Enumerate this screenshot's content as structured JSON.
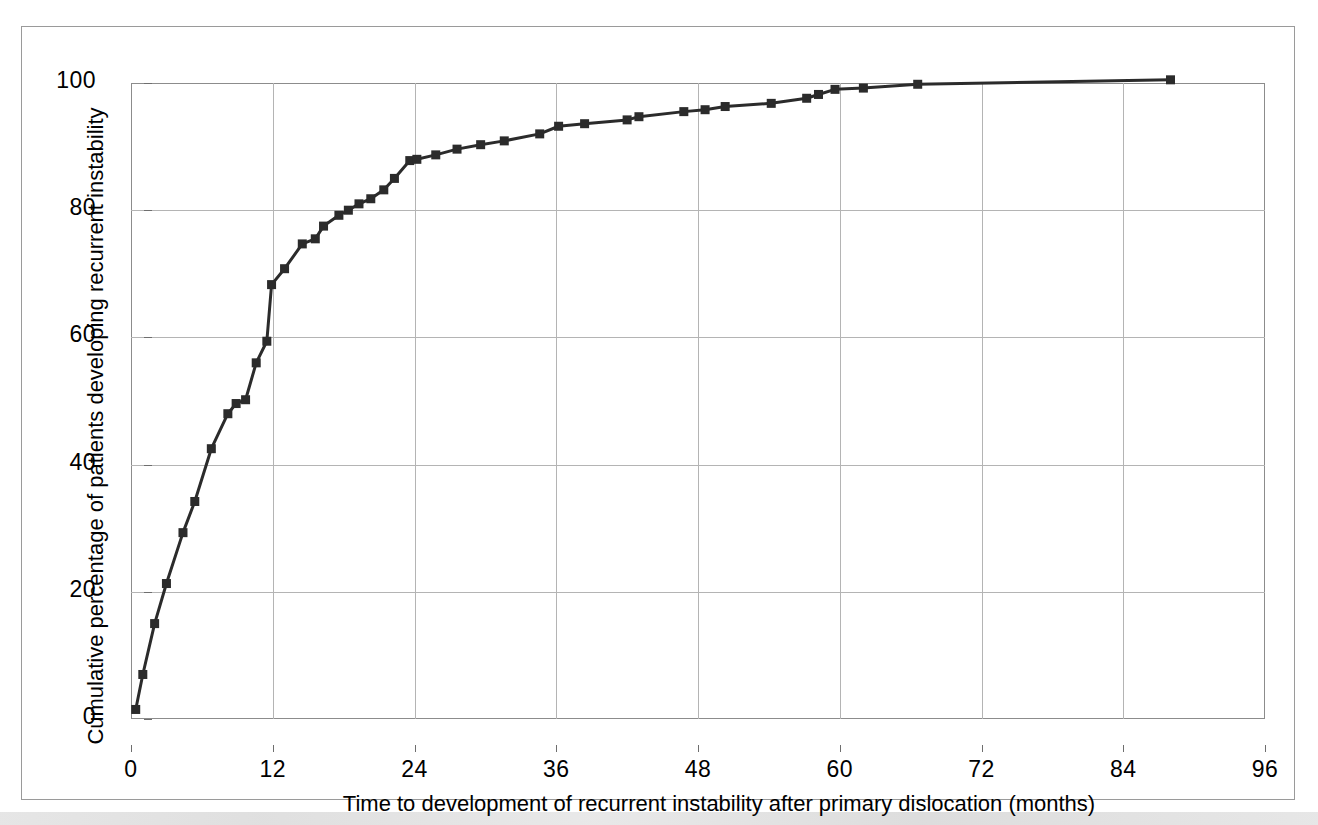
{
  "figure": {
    "kind": "line-chart",
    "background": "#ffffff",
    "frame_color": "#9a9a9a"
  },
  "chart_data": {
    "type": "line",
    "title": "",
    "subtitle": "",
    "xlabel": "Time to development of recurrent instability after primary dislocation (months)",
    "ylabel": "Cumulative percentage of patients developing recurrent instability",
    "xlim": [
      0,
      96
    ],
    "ylim": [
      0,
      100
    ],
    "xticks": [
      0,
      12,
      24,
      36,
      48,
      60,
      72,
      84,
      96
    ],
    "yticks": [
      0,
      20,
      40,
      60,
      80,
      100
    ],
    "xtick_labels": [
      "0",
      "12",
      "24",
      "36",
      "48",
      "60",
      "72",
      "84",
      "96"
    ],
    "ytick_labels": [
      "0",
      "20",
      "40",
      "60",
      "80",
      "100"
    ],
    "grid": true,
    "grid_color": "#b4b4b4",
    "legend": false,
    "legend_position": "none",
    "marker": "square",
    "marker_size": 9,
    "line_color": "#2b2b2b",
    "line_width": 3,
    "series": [
      {
        "name": "Cumulative recurrent instability",
        "x": [
          0.4,
          1.0,
          2.0,
          3.0,
          4.4,
          5.4,
          6.8,
          8.2,
          8.9,
          9.7,
          10.6,
          11.5,
          11.9,
          13.0,
          14.5,
          15.6,
          16.3,
          17.6,
          18.4,
          19.3,
          20.3,
          21.4,
          22.3,
          23.6,
          24.2,
          25.8,
          27.6,
          29.6,
          31.6,
          34.6,
          36.2,
          38.4,
          42.0,
          43.0,
          46.8,
          48.6,
          50.3,
          54.2,
          57.2,
          58.2,
          59.6,
          62.0,
          66.6,
          88.0
        ],
        "y": [
          1.5,
          7.0,
          15.0,
          21.3,
          29.3,
          34.2,
          42.5,
          48.0,
          49.6,
          50.2,
          56.0,
          59.4,
          68.3,
          70.8,
          74.7,
          75.5,
          77.5,
          79.2,
          80.0,
          81.0,
          81.8,
          83.2,
          85.0,
          87.8,
          88.0,
          88.7,
          89.6,
          90.3,
          90.9,
          92.0,
          93.2,
          93.6,
          94.2,
          94.7,
          95.5,
          95.8,
          96.3,
          96.8,
          97.6,
          98.2,
          99.0,
          99.2,
          99.8,
          100.5
        ]
      }
    ]
  }
}
